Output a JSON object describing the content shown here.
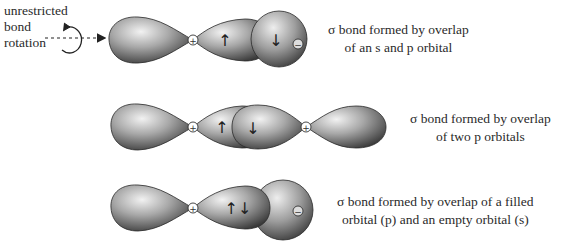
{
  "rotation_label": {
    "lines": [
      "unrestricted",
      "bond",
      "rotation"
    ]
  },
  "rows": [
    {
      "id": "s-p-overlap",
      "caption_lines": [
        "σ bond formed by overlap",
        "of an s and p orbital"
      ],
      "nuclei": [
        "+",
        "−"
      ],
      "electrons": [
        "↑",
        "↓"
      ]
    },
    {
      "id": "p-p-overlap",
      "caption_lines": [
        "σ bond formed by overlap",
        "of two p orbitals"
      ],
      "nuclei": [
        "+",
        "+"
      ],
      "electrons": [
        "↑",
        "↓"
      ]
    },
    {
      "id": "filled-empty-overlap",
      "caption_lines": [
        "σ bond formed by overlap of a filled",
        "orbital (p) and an empty orbital (s)"
      ],
      "nuclei": [
        "+",
        "−"
      ],
      "electrons": [
        "↑↓"
      ]
    }
  ],
  "colors": {
    "orbital_dark": "#3a3a3a",
    "orbital_mid": "#8a8a8a",
    "orbital_light": "#e8e8e8",
    "text": "#2a2a2a"
  }
}
